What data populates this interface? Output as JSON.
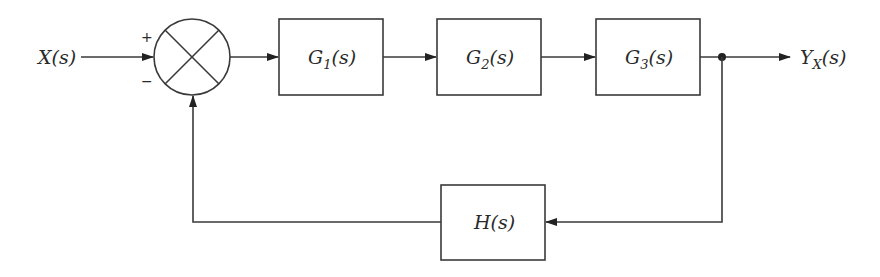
{
  "diagram": {
    "type": "closed-loop block diagram (negative feedback)",
    "input": {
      "label": "X(s)",
      "main": "X",
      "arg": "(s)"
    },
    "output": {
      "label": "Y_X(s)",
      "main": "Y",
      "sub": "X",
      "arg": "(s)"
    },
    "summing_junction": {
      "plus_sign": "+",
      "minus_sign": "−"
    },
    "forward_blocks": [
      {
        "label": "G_1(s)",
        "main": "G",
        "sub": "1",
        "arg": "(s)"
      },
      {
        "label": "G_2(s)",
        "main": "G",
        "sub": "2",
        "arg": "(s)"
      },
      {
        "label": "G_3(s)",
        "main": "G",
        "sub": "3",
        "arg": "(s)"
      }
    ],
    "feedback_block": {
      "label": "H(s)",
      "main": "H",
      "arg": "(s)"
    },
    "colors": {
      "stroke": "#3a3a3a",
      "text": "#2a2a2a",
      "background": "#ffffff"
    }
  }
}
